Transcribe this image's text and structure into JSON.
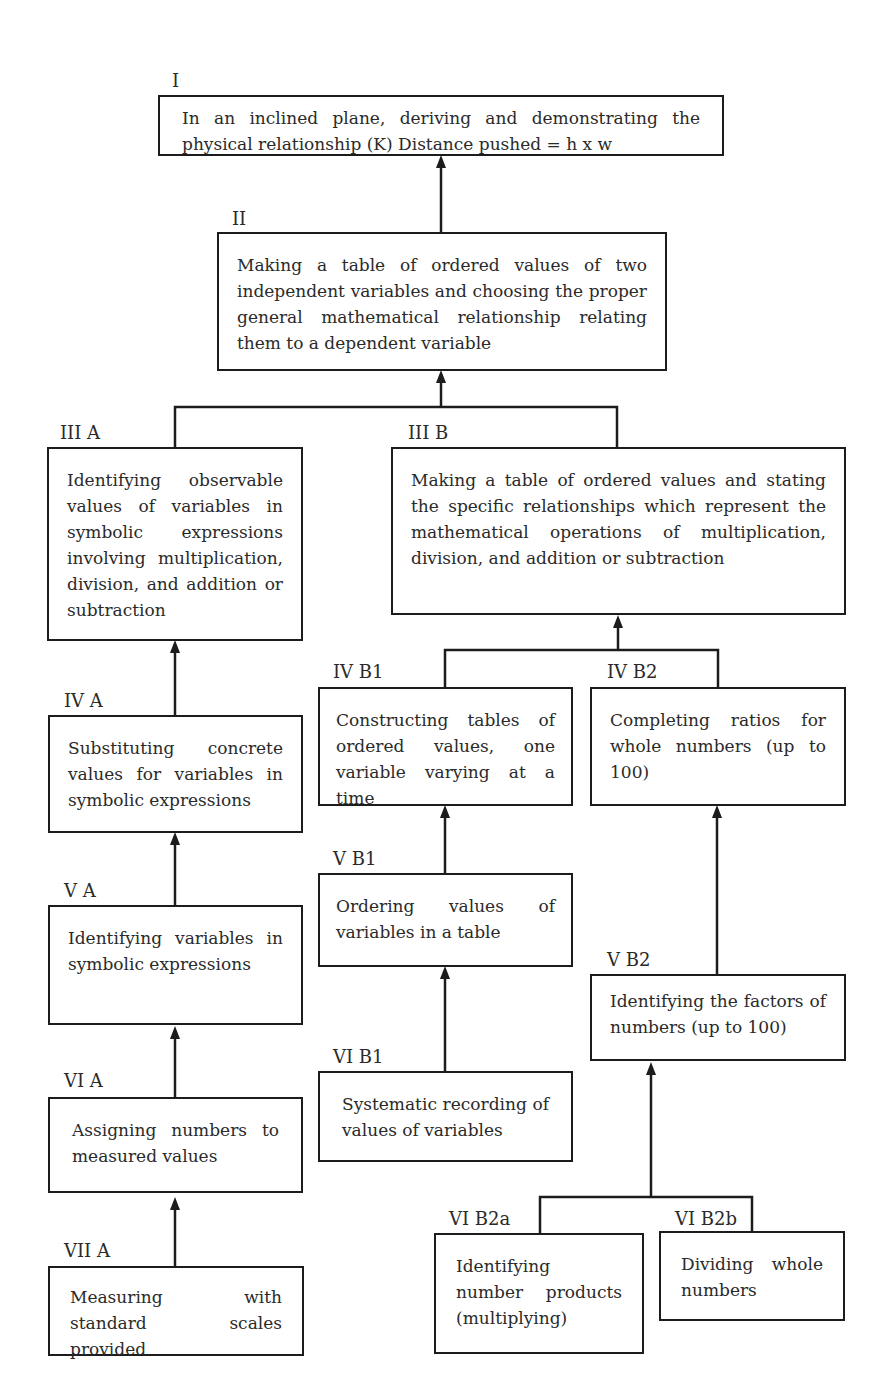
{
  "nodes": {
    "I": {
      "label": "I",
      "text": "In an inclined plane, deriving and demonstrating the physical relationship (K) Distance pushed = h x w"
    },
    "II": {
      "label": "II",
      "text": "Making a table of ordered values of two independent variables and choosing the proper general mathematical relationship relating them to a dependent variable"
    },
    "IIIA": {
      "label": "III A",
      "text": "Identifying observable values of variables in symbolic expressions involving multiplication, division, and addition or subtraction"
    },
    "IIIB": {
      "label": "III B",
      "text": "Making a table of ordered values and stating the specific relationships which represent the mathematical operations of multiplication, division, and addition or subtraction"
    },
    "IVA": {
      "label": "IV A",
      "text": "Substituting concrete values for variables in symbolic expressions"
    },
    "IVB1": {
      "label": "IV B1",
      "text": "Constructing tables of ordered values, one variable varying at a time"
    },
    "IVB2": {
      "label": "IV B2",
      "text": "Completing ratios for whole numbers (up to 100)"
    },
    "VA": {
      "label": "V A",
      "text": "Identifying variables in symbolic expressions"
    },
    "VB1": {
      "label": "V B1",
      "text": "Ordering values of variables in a table"
    },
    "VB2": {
      "label": "V B2",
      "text": "Identifying the factors of numbers (up to 100)"
    },
    "VIA": {
      "label": "VI A",
      "text": "Assigning numbers to measured values"
    },
    "VIB1": {
      "label": "VI B1",
      "text": "Systematic recording of values of variables"
    },
    "VIB2a": {
      "label": "VI B2a",
      "text": "Identifying number products (multiplying)"
    },
    "VIB2b": {
      "label": "VI B2b",
      "text": "Dividing whole numbers"
    },
    "VIIA": {
      "label": "VII A",
      "text": "Measuring with standard scales provided"
    }
  },
  "edges": [
    {
      "from": "II",
      "to": "I"
    },
    {
      "from": "IIIA",
      "to": "II"
    },
    {
      "from": "IIIB",
      "to": "II"
    },
    {
      "from": "IVA",
      "to": "IIIA"
    },
    {
      "from": "IVB1",
      "to": "IIIB"
    },
    {
      "from": "IVB2",
      "to": "IIIB"
    },
    {
      "from": "VA",
      "to": "IVA"
    },
    {
      "from": "VB1",
      "to": "IVB1"
    },
    {
      "from": "VB2",
      "to": "IVB2"
    },
    {
      "from": "VIA",
      "to": "VA"
    },
    {
      "from": "VIB1",
      "to": "VB1"
    },
    {
      "from": "VIB2a",
      "to": "VB2"
    },
    {
      "from": "VIB2b",
      "to": "VB2"
    },
    {
      "from": "VIIA",
      "to": "VIA"
    }
  ]
}
